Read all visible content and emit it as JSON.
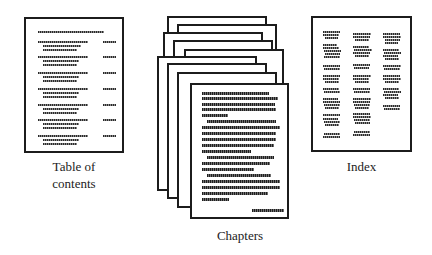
{
  "diagram": {
    "parts": [
      {
        "id": "toc",
        "label_line1": "Table of",
        "label_line2": "contents"
      },
      {
        "id": "chapters",
        "label": "Chapters",
        "page_count": 9
      },
      {
        "id": "index",
        "label": "Index",
        "columns": 3
      }
    ]
  },
  "labels": {
    "toc_line1": "Table of",
    "toc_line2": "contents",
    "chapters": "Chapters",
    "index": "Index"
  },
  "colors": {
    "ink": "#1c1c1c",
    "paper": "#ffffff",
    "greeked_text": "#2a2a2a"
  }
}
